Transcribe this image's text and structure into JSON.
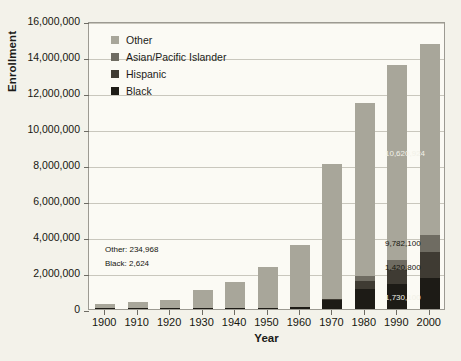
{
  "chart_data": {
    "type": "bar",
    "subtype": "stacked-bar",
    "title": "",
    "xlabel": "Year",
    "ylabel": "Enrollment",
    "categories": [
      "1900",
      "1910",
      "1920",
      "1930",
      "1940",
      "1950",
      "1960",
      "1970",
      "1980",
      "1990",
      "2000"
    ],
    "ylim": [
      0,
      16000000
    ],
    "ytick_labels": [
      "0",
      "2,000,000",
      "4,000,000",
      "6,000,000",
      "8,000,000",
      "10,000,000",
      "12,000,000",
      "14,000,000",
      "16,000,000"
    ],
    "ytick_values": [
      0,
      2000000,
      4000000,
      6000000,
      8000000,
      10000000,
      12000000,
      14000000,
      16000000
    ],
    "grid": true,
    "legend_position": "top-left-inside",
    "series": [
      {
        "name": "Black",
        "color": "#1d1b16",
        "values": [
          2624,
          4000,
          8000,
          14000,
          27000,
          61000,
          134000,
          522000,
          1107000,
          1393000,
          1730000
        ]
      },
      {
        "name": "Hispanic",
        "color": "#3f3b33",
        "values": [
          0,
          0,
          0,
          0,
          0,
          0,
          0,
          50000,
          443000,
          783000,
          1420000
        ]
      },
      {
        "name": "Asian/Pacific Islander",
        "color": "#6f6c62",
        "values": [
          0,
          0,
          0,
          0,
          0,
          0,
          0,
          0,
          286000,
          572000,
          978000
        ]
      },
      {
        "name": "Other",
        "color": "#a8a69a",
        "values": [
          234968,
          351000,
          462000,
          986000,
          1467000,
          2297000,
          3450000,
          7500000,
          9600000,
          10800000,
          10620924
        ]
      }
    ],
    "annotations": [
      {
        "text": "Other: 234,968",
        "near_category": "1900",
        "series": "Other"
      },
      {
        "text": "Black: 2,624",
        "near_category": "1900",
        "series": "Black"
      },
      {
        "text": "10,620,924",
        "near_category": "2000",
        "series": "Other"
      },
      {
        "text": "9,782,100",
        "near_category": "2000",
        "series": "Asian/Pacific Islander"
      },
      {
        "text": "1,420,800",
        "near_category": "2000",
        "series": "Hispanic"
      },
      {
        "text": "1,730,100",
        "near_category": "2000",
        "series": "Black"
      }
    ]
  },
  "legend": {
    "items": [
      {
        "label": "Other",
        "color": "#a8a69a"
      },
      {
        "label": "Asian/Pacific Islander",
        "color": "#6f6c62"
      },
      {
        "label": "Hispanic",
        "color": "#3f3b33"
      },
      {
        "label": "Black",
        "color": "#1d1b16"
      }
    ]
  }
}
